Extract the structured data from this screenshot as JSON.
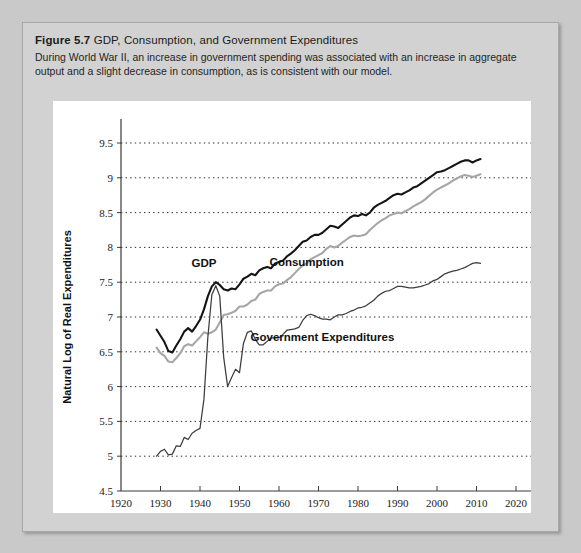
{
  "figure": {
    "number": "Figure 5.7",
    "title": "GDP, Consumption, and Government Expenditures",
    "description": "During World War II, an increase in government spending was associated with an increase in aggregate output and a slight decrease in consumption, as is consistent with our model."
  },
  "colors": {
    "page_background": "#c9c9c9",
    "figure_background": "#d2d2d2",
    "panel_background": "#ffffff",
    "gdp": "#151515",
    "consumption": "#a6a6a6",
    "government_expenditures": "#3d3d3d",
    "axis": "#3a3a3a",
    "gridline": "#2a2a2a"
  },
  "chart_data": {
    "type": "line",
    "title": "GDP, Consumption, and Government Expenditures",
    "xlabel": "Year",
    "ylabel": "Natural Log of Real Expenditures",
    "xlim": [
      1920,
      2020
    ],
    "ylim": [
      4.5,
      9.5
    ],
    "xticks": [
      1920,
      1930,
      1940,
      1950,
      1960,
      1970,
      1980,
      1990,
      2000,
      2010,
      2020
    ],
    "yticks": [
      4.5,
      5,
      5.5,
      6,
      6.5,
      7,
      7.5,
      8,
      8.5,
      9,
      9.5
    ],
    "grid": "horizontal-dotted",
    "legend": "inline-annotations",
    "annotations": [
      {
        "text": "GDP",
        "x": 1941,
        "y": 7.72
      },
      {
        "text": "Consumption",
        "x": 1967,
        "y": 7.73
      },
      {
        "text": "Government Expenditures",
        "x": 1971,
        "y": 6.66
      }
    ],
    "x": [
      1929,
      1930,
      1931,
      1932,
      1933,
      1934,
      1935,
      1936,
      1937,
      1938,
      1939,
      1940,
      1941,
      1942,
      1943,
      1944,
      1945,
      1946,
      1947,
      1948,
      1949,
      1950,
      1951,
      1952,
      1953,
      1954,
      1955,
      1956,
      1957,
      1958,
      1959,
      1960,
      1961,
      1962,
      1963,
      1964,
      1965,
      1966,
      1967,
      1968,
      1969,
      1970,
      1971,
      1972,
      1973,
      1974,
      1975,
      1976,
      1977,
      1978,
      1979,
      1980,
      1981,
      1982,
      1983,
      1984,
      1985,
      1986,
      1987,
      1988,
      1989,
      1990,
      1991,
      1992,
      1993,
      1994,
      1995,
      1996,
      1997,
      1998,
      1999,
      2000,
      2001,
      2002,
      2003,
      2004,
      2005,
      2006,
      2007,
      2008,
      2009,
      2010,
      2011
    ],
    "series": [
      {
        "name": "GDP",
        "color": "#151515",
        "values": [
          6.82,
          6.73,
          6.64,
          6.51,
          6.49,
          6.59,
          6.68,
          6.79,
          6.84,
          6.79,
          6.87,
          6.96,
          7.11,
          7.3,
          7.44,
          7.5,
          7.46,
          7.4,
          7.38,
          7.41,
          7.4,
          7.47,
          7.55,
          7.58,
          7.62,
          7.6,
          7.67,
          7.7,
          7.72,
          7.7,
          7.77,
          7.79,
          7.81,
          7.87,
          7.91,
          7.96,
          8.02,
          8.08,
          8.1,
          8.15,
          8.18,
          8.18,
          8.21,
          8.26,
          8.31,
          8.3,
          8.28,
          8.33,
          8.38,
          8.43,
          8.46,
          8.45,
          8.48,
          8.46,
          8.5,
          8.57,
          8.61,
          8.64,
          8.67,
          8.71,
          8.75,
          8.77,
          8.76,
          8.79,
          8.82,
          8.86,
          8.88,
          8.92,
          8.96,
          9.0,
          9.04,
          9.08,
          9.09,
          9.11,
          9.14,
          9.17,
          9.2,
          9.23,
          9.25,
          9.25,
          9.22,
          9.25,
          9.27
        ]
      },
      {
        "name": "Consumption",
        "color": "#a6a6a6",
        "values": [
          6.56,
          6.48,
          6.44,
          6.36,
          6.35,
          6.41,
          6.48,
          6.58,
          6.61,
          6.59,
          6.65,
          6.71,
          6.78,
          6.76,
          6.78,
          6.82,
          6.92,
          7.03,
          7.04,
          7.06,
          7.09,
          7.15,
          7.15,
          7.18,
          7.23,
          7.25,
          7.33,
          7.36,
          7.38,
          7.38,
          7.44,
          7.47,
          7.48,
          7.53,
          7.57,
          7.63,
          7.69,
          7.74,
          7.77,
          7.83,
          7.86,
          7.89,
          7.92,
          7.98,
          8.02,
          8.0,
          8.02,
          8.07,
          8.11,
          8.15,
          8.17,
          8.16,
          8.17,
          8.19,
          8.25,
          8.3,
          8.35,
          8.39,
          8.42,
          8.46,
          8.48,
          8.5,
          8.49,
          8.52,
          8.55,
          8.59,
          8.62,
          8.65,
          8.69,
          8.74,
          8.79,
          8.83,
          8.86,
          8.89,
          8.92,
          8.96,
          8.99,
          9.02,
          9.04,
          9.03,
          9.01,
          9.03,
          9.05
        ]
      },
      {
        "name": "Government Expenditures",
        "color": "#3d3d3d",
        "values": [
          5.0,
          5.07,
          5.1,
          5.02,
          5.03,
          5.15,
          5.14,
          5.27,
          5.24,
          5.33,
          5.37,
          5.4,
          5.82,
          6.72,
          7.32,
          7.45,
          7.3,
          6.42,
          6.0,
          6.13,
          6.25,
          6.2,
          6.62,
          6.78,
          6.8,
          6.68,
          6.6,
          6.6,
          6.65,
          6.7,
          6.7,
          6.7,
          6.75,
          6.81,
          6.82,
          6.83,
          6.85,
          6.95,
          7.02,
          7.04,
          7.02,
          6.99,
          6.97,
          6.97,
          6.96,
          7.0,
          7.03,
          7.03,
          7.05,
          7.08,
          7.1,
          7.13,
          7.14,
          7.16,
          7.2,
          7.24,
          7.3,
          7.34,
          7.37,
          7.38,
          7.41,
          7.44,
          7.44,
          7.43,
          7.42,
          7.42,
          7.43,
          7.44,
          7.46,
          7.48,
          7.52,
          7.54,
          7.58,
          7.62,
          7.64,
          7.66,
          7.67,
          7.69,
          7.71,
          7.74,
          7.77,
          7.78,
          7.77
        ]
      }
    ]
  }
}
